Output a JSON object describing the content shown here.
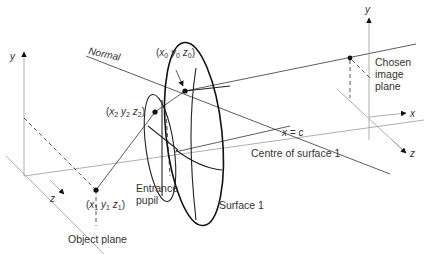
{
  "diagram": {
    "labels": {
      "normal": "Normal",
      "point0": {
        "open": "(",
        "x": "x",
        "x_sub": "0",
        "y": "y",
        "y_sub": "0",
        "z": "z",
        "z_sub": "0",
        "close": ")"
      },
      "point1": {
        "open": "(",
        "x": "x",
        "x_sub": "1",
        "y": "y",
        "y_sub": "1",
        "z": "z",
        "z_sub": "1",
        "close": ")"
      },
      "point2": {
        "open": "(",
        "x": "x",
        "x_sub": "2",
        "y": "y",
        "y_sub": "2",
        "z": "z",
        "z_sub": "2",
        "close": ")"
      },
      "x_eq_c": "x = c",
      "centre_of_surface": "Centre of surface 1",
      "surface1": "Surface 1",
      "entrance_pupil_line1": "Entrance",
      "entrance_pupil_line2": "pupil",
      "object_plane": "Object plane",
      "chosen_line1": "Chosen",
      "chosen_line2": "image",
      "chosen_line3": "plane"
    },
    "left_axes": {
      "y_label": "y",
      "z_label": "z"
    },
    "right_axes": {
      "y_label": "y",
      "x_label": "x",
      "z_label": "z"
    }
  }
}
